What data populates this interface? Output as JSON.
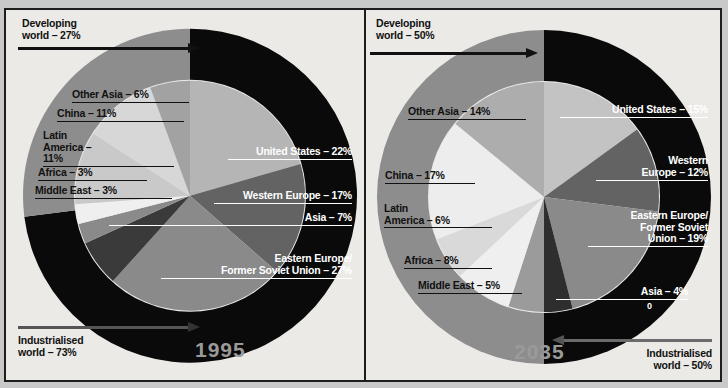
{
  "figure": {
    "background": "#eceae6",
    "border_color": "#1d1d1d",
    "outer_background": "#c9c9c9"
  },
  "chart_data": [
    {
      "type": "pie",
      "title": "1995",
      "year_label": "1995",
      "outer_ring": {
        "name": "world-split-ring",
        "segments": [
          {
            "label": "Developing world – 27%",
            "name": "Developing world",
            "value": 27,
            "color": "#8d8d8d"
          },
          {
            "label": "Industrialised world – 73%",
            "name": "Industrialised world",
            "value": 73,
            "color": "#0a0a0a"
          }
        ]
      },
      "categories": [
        "United States",
        "Western Europe",
        "Eastern Europe/Former Soviet Union",
        "Asia",
        "Middle East",
        "Africa",
        "Latin America",
        "China",
        "Other Asia"
      ],
      "values": [
        22,
        17,
        27,
        7,
        3,
        3,
        11,
        11,
        6
      ],
      "labels": [
        "United States – 22%",
        "Western Europe – 17%",
        "Eastern Europe/\nFormer Soviet Union – 27%",
        "Asia – 7%",
        "Middle East – 3%",
        "Africa – 3%",
        "Latin America – 11%",
        "China – 11%",
        "Other Asia – 6%"
      ],
      "colors": [
        "#b5b5b5",
        "#636363",
        "#8a8a8a",
        "#3a3a3a",
        "#8a8a8a",
        "#efefef",
        "#c9c9c9",
        "#d7d7d7",
        "#a2a2a2"
      ],
      "developing_arrow": "left-to-right",
      "industrialised_arrow": "left-to-right"
    },
    {
      "type": "pie",
      "title": "2035",
      "year_label": "2035",
      "outer_ring": {
        "name": "world-split-ring",
        "segments": [
          {
            "label": "Developing world – 50%",
            "name": "Developing world",
            "value": 50,
            "color": "#8d8d8d"
          },
          {
            "label": "Industrialised world – 50%",
            "name": "Industrialised world",
            "value": 50,
            "color": "#0a0a0a"
          }
        ]
      },
      "categories": [
        "United States",
        "Western Europe",
        "Eastern Europe/Former Soviet Union",
        "Asia",
        "Middle East",
        "Africa",
        "Latin America",
        "China",
        "Other Asia"
      ],
      "values": [
        15,
        12,
        19,
        4,
        5,
        8,
        6,
        17,
        14
      ],
      "labels": [
        "United States – 15%",
        "Western\nEurope – 12%",
        "Eastern Europe/\nFormer Soviet\nUnion – 19%",
        "Asia – 4%",
        "Middle East – 5%",
        "Africa – 8%",
        "Latin\nAmerica – 6%",
        "China – 17%",
        "Other Asia – 14%"
      ],
      "colors": [
        "#c3c3c3",
        "#636363",
        "#8a8a8a",
        "#2e2e2e",
        "#9b9b9b",
        "#efefef",
        "#d9d9d9",
        "#ededed",
        "#adadad"
      ],
      "developing_arrow": "left-to-right",
      "industrialised_arrow": "right-to-left",
      "stray_mark": "0"
    }
  ],
  "left": {
    "developing": "Developing\nworld – 27%",
    "developing_l1": "Developing",
    "developing_l2": "world – 27%",
    "industrialised_l1": "Industrialised",
    "industrialised_l2": "world – 73%",
    "other_asia": "Other Asia – 6%",
    "china": "China – 11%",
    "latin_l1": "Latin",
    "latin_l2": "America –",
    "latin_l3": "11%",
    "africa": "Africa – 3%",
    "middle_east": "Middle East – 3%",
    "united_states": "United States – 22%",
    "western_europe": "Western Europe – 17%",
    "asia": "Asia – 7%",
    "eastern_l1": "Eastern Europe/",
    "eastern_l2": "Former Soviet Union – 27%",
    "year": "1995"
  },
  "right": {
    "developing_l1": "Developing",
    "developing_l2": "world – 50%",
    "industrialised_l1": "Industrialised",
    "industrialised_l2": "world – 50%",
    "other_asia": "Other Asia – 14%",
    "china": "China – 17%",
    "latin_l1": "Latin",
    "latin_l2": "America – 6%",
    "africa": "Africa – 8%",
    "middle_east": "Middle East – 5%",
    "united_states": "United States – 15%",
    "western_l1": "Western",
    "western_l2": "Europe – 12%",
    "eastern_l1": "Eastern Europe/",
    "eastern_l2": "Former Soviet",
    "eastern_l3": "Union – 19%",
    "asia": "Asia – 4%",
    "stray": "0",
    "year": "2035"
  }
}
